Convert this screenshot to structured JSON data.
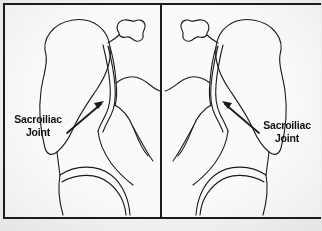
{
  "figure": {
    "type": "anatomical-line-drawing",
    "panel_count": 2,
    "background_color": "#f4f3f1",
    "ink_color": "#1c1c1c",
    "frame": {
      "border_color": "#1c1c1c",
      "divider_orientation": "vertical"
    }
  },
  "panels": [
    {
      "id": "left",
      "view": "oblique-pelvis-left",
      "label": {
        "line1": "Sacroiliac",
        "line2": "Joint"
      },
      "annotation": {
        "kind": "arrow",
        "points_to": "sacroiliac-joint-space",
        "direction": "up-right"
      },
      "structures": [
        "iliac-wing",
        "sacroiliac-joint-space",
        "sacrum",
        "vertebral-spinous-process",
        "obturator-foramen",
        "femoral-head-contour"
      ]
    },
    {
      "id": "right",
      "view": "oblique-pelvis-right-mirrored",
      "label": {
        "line1": "Sacroiliac",
        "line2": "Joint"
      },
      "annotation": {
        "kind": "arrow",
        "points_to": "sacroiliac-joint-space",
        "direction": "up-left"
      },
      "structures": [
        "iliac-wing",
        "sacroiliac-joint-space",
        "sacrum",
        "vertebral-spinous-process",
        "obturator-foramen",
        "femoral-head-contour"
      ]
    }
  ]
}
